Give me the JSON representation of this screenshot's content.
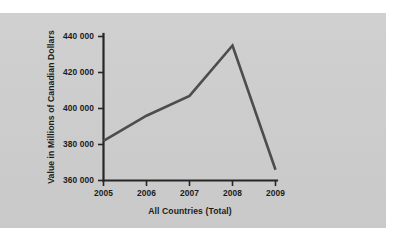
{
  "figure": {
    "background_color": "#ffffff",
    "panel_color": "#cdcdcd",
    "line_color": "#4d4d4d",
    "axis_color": "#262626",
    "text_color": "#1c1c1c"
  },
  "chart_data": {
    "type": "line",
    "title": "",
    "subtitle": "",
    "xlabel": "All Countries (Total)",
    "ylabel": "Value in Millions of Canadian Dollars",
    "categories": [
      "2005",
      "2006",
      "2007",
      "2008",
      "2009"
    ],
    "x": [
      2005,
      2006,
      2007,
      2008,
      2009
    ],
    "values": [
      382000,
      396000,
      407000,
      435000,
      366000
    ],
    "series": [
      {
        "name": "All Countries (Total)",
        "values": [
          382000,
          396000,
          407000,
          435000,
          366000
        ]
      }
    ],
    "ylim": [
      360000,
      440000
    ],
    "yticks": [
      360000,
      380000,
      400000,
      420000,
      440000
    ],
    "ytick_labels": [
      "360 000",
      "380 000",
      "400 000",
      "420 000",
      "440 000"
    ],
    "xtick_labels": [
      "2005",
      "2006",
      "2007",
      "2008",
      "2009"
    ],
    "grid": false,
    "legend": false,
    "legend_position": "none",
    "annotations": []
  }
}
